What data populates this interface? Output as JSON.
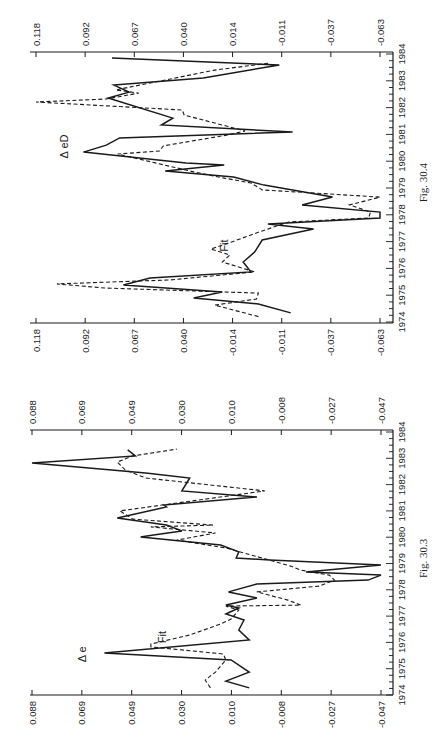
{
  "page": {
    "orientation": "rotated-90-ccw",
    "background": "#ffffff",
    "ink": "#1a1a1a"
  },
  "chart_data": [
    {
      "id": "fig-30-4",
      "type": "line",
      "caption": "Fig. 30.4",
      "title": "",
      "xlabel": "",
      "ylabel": "",
      "x_ticks": [
        "1974",
        "1975",
        "1976",
        "1977",
        "1978",
        "1979",
        "1980",
        "1981",
        "1982",
        "1983",
        "1984"
      ],
      "xlim": [
        1974,
        1984
      ],
      "y_ticks_left": [
        "0.118",
        "0.092",
        "0.067",
        "0.040",
        "-0.014",
        "-0.011",
        "-0.037",
        "-0.063"
      ],
      "y_ticks_right": [
        "0.118",
        "0.092",
        "0.067",
        "0.040",
        "0.014",
        "-0.011",
        "-0.037",
        "-0.063"
      ],
      "ylim": [
        -0.063,
        0.118
      ],
      "grid": false,
      "legend": "inline labels",
      "annotations": [
        {
          "text": "Δ eD",
          "series": "ΔeD",
          "year": 1980.55,
          "value": 0.101
        },
        {
          "text": "Fit",
          "series": "Fit",
          "year": 1976.85,
          "value": 0.017
        }
      ],
      "series": [
        {
          "name": "ΔeD",
          "style": "solid",
          "x": [
            1974.34,
            1974.67,
            1974.9,
            1975.12,
            1975.38,
            1975.64,
            1975.87,
            1976.24,
            1976.61,
            1977.06,
            1977.47,
            1977.66,
            1977.88,
            1978.1,
            1978.37,
            1978.66,
            1979.11,
            1979.41,
            1979.63,
            1979.86,
            1979.93,
            1980.34,
            1980.6,
            1980.87,
            1981.09,
            1981.35,
            1981.61,
            1982.36,
            1982.58,
            1982.84,
            1983.1,
            1983.59,
            1983.85
          ],
          "values": [
            -0.016,
            0.001,
            0.035,
            0.02,
            0.072,
            0.058,
            0.005,
            0.009,
            0.003,
            -0.001,
            -0.028,
            -0.004,
            -0.063,
            -0.063,
            -0.022,
            -0.038,
            -0.002,
            0.014,
            0.05,
            0.019,
            0.039,
            0.093,
            0.081,
            0.074,
            -0.017,
            0.052,
            0.046,
            0.08,
            0.069,
            0.077,
            0.03,
            -0.01,
            0.078
          ]
        },
        {
          "name": "Fit",
          "style": "dashed",
          "x": [
            1974.2,
            1974.63,
            1974.86,
            1975.08,
            1975.27,
            1975.42,
            1975.57,
            1975.87,
            1976.24,
            1976.5,
            1976.72,
            1976.99,
            1977.4,
            1977.73,
            1977.88,
            1978.1,
            1978.37,
            1978.66,
            1978.93,
            1979.19,
            1979.37,
            1979.6,
            1980.27,
            1980.38,
            1980.57,
            1980.98,
            1981.13,
            1981.72,
            1981.91,
            1982.21,
            1982.32,
            1982.54,
            1982.66,
            1983.4,
            1983.66
          ],
          "values": [
            0.001,
            0.024,
            0.002,
            0.001,
            0.082,
            0.107,
            0.047,
            0.003,
            0.02,
            0.016,
            0.026,
            0.015,
            -0.001,
            -0.015,
            -0.057,
            -0.058,
            -0.047,
            -0.063,
            -0.001,
            0.005,
            0.019,
            0.035,
            0.075,
            0.053,
            0.051,
            0.017,
            0.008,
            0.04,
            0.041,
            0.118,
            0.081,
            0.064,
            0.076,
            0.024,
            -0.005
          ]
        }
      ],
      "frame_px": {
        "left": 30,
        "right": 393,
        "top": 52,
        "bottom": 323
      },
      "value_px": {
        "max_x": 36,
        "min_x": 380
      },
      "year_px": {
        "y1974": 322,
        "y1984": 54
      }
    },
    {
      "id": "fig-30-3",
      "type": "line",
      "caption": "Fig. 30.3",
      "title": "",
      "xlabel": "",
      "ylabel": "",
      "x_ticks": [
        "1974",
        "1975",
        "1976",
        "1977",
        "1978",
        "1979",
        "1980",
        "1981",
        "1982",
        "1983",
        "1984"
      ],
      "xlim": [
        1974,
        1984
      ],
      "y_ticks_left": [
        "0.088",
        "0.069",
        "0.049",
        "0.030",
        "0.010",
        "-0.008",
        "-0.027",
        "-0.047"
      ],
      "y_ticks_right": [
        "0.088",
        "0.069",
        "0.049",
        "0.030",
        "0.010",
        "-0.008",
        "-0.027",
        "-0.047"
      ],
      "ylim": [
        -0.047,
        0.088
      ],
      "grid": false,
      "legend": "inline labels",
      "annotations": [
        {
          "text": "Δ e",
          "series": "Δe",
          "year": 1975.55,
          "value": 0.067
        },
        {
          "text": "Fit",
          "series": "Fit",
          "year": 1976.2,
          "value": 0.036
        }
      ],
      "series": [
        {
          "name": "Δe",
          "style": "solid",
          "x": [
            1974.27,
            1974.53,
            1974.87,
            1975.33,
            1975.6,
            1976.09,
            1976.47,
            1976.85,
            1977.08,
            1977.31,
            1977.42,
            1977.69,
            1977.92,
            1978.22,
            1978.37,
            1978.56,
            1978.68,
            1978.94,
            1979.13,
            1979.21,
            1979.44,
            1979.7,
            1980.01,
            1980.08,
            1980.24,
            1980.46,
            1980.73,
            1981.15,
            1981.22,
            1981.53,
            1981.76,
            1982.25,
            1982.44,
            1982.82,
            1983.09,
            1983.32
          ],
          "values": [
            0.004,
            0.013,
            0.004,
            0.011,
            0.06,
            0.004,
            0.008,
            0.006,
            0.013,
            0.008,
            0.013,
            0.001,
            0.012,
            0.001,
            -0.042,
            -0.047,
            -0.018,
            -0.047,
            -0.004,
            0.009,
            0.008,
            0.015,
            0.046,
            0.041,
            0.03,
            0.036,
            0.055,
            0.036,
            0.037,
            0.001,
            0.03,
            0.027,
            0.044,
            0.088,
            0.048,
            0.051
          ]
        },
        {
          "name": "Fit",
          "style": "dashed",
          "x": [
            1974.27,
            1974.57,
            1974.87,
            1975.33,
            1975.56,
            1975.83,
            1975.94,
            1976.28,
            1976.7,
            1976.89,
            1977.23,
            1977.38,
            1977.42,
            1977.61,
            1977.92,
            1978.14,
            1978.37,
            1978.56,
            1978.75,
            1978.9,
            1979.21,
            1979.59,
            1979.89,
            1980.16,
            1980.39,
            1980.46,
            1980.69,
            1981.0,
            1981.76,
            1982.25,
            1982.56,
            1982.86,
            1983.09,
            1983.35
          ],
          "values": [
            0.019,
            0.021,
            0.017,
            0.013,
            0.014,
            0.042,
            0.042,
            0.027,
            0.015,
            0.011,
            0.008,
            0.013,
            -0.016,
            -0.011,
            0.001,
            -0.023,
            -0.029,
            -0.027,
            -0.016,
            -0.012,
            -0.001,
            0.013,
            0.032,
            0.017,
            0.042,
            0.018,
            0.049,
            0.054,
            -0.002,
            0.044,
            0.052,
            0.055,
            0.049,
            0.032
          ]
        }
      ],
      "frame_px": {
        "left": 30,
        "right": 393,
        "top": 430,
        "bottom": 695
      },
      "value_px": {
        "max_x": 32,
        "min_x": 381
      },
      "year_px": {
        "y1974": 695,
        "y1984": 432
      }
    }
  ]
}
